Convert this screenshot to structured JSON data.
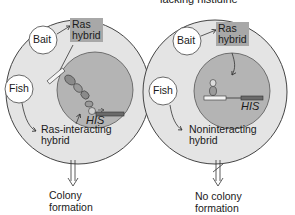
{
  "header": {
    "caption": "lacking histidine"
  },
  "panels": [
    {
      "bait_label": "Bait",
      "bait_product": "Ras\nhybrid",
      "bait_product_line1": "Ras",
      "bait_product_line2": "hybrid",
      "fish_label": "Fish",
      "fish_product_line1": "Ras-interacting",
      "fish_product_line2": "hybrid",
      "reporter_gene": "HIS",
      "outcome_line1": "Colony",
      "outcome_line2": "formation",
      "arrow": "double-arrow-down"
    },
    {
      "bait_label": "Bait",
      "bait_product_line1": "Ras",
      "bait_product_line2": "hybrid",
      "fish_label": "Fish",
      "fish_product_line1": "Noninteracting",
      "fish_product_line2": "hybrid",
      "reporter_gene": "HIS",
      "outcome_line1": "No colony",
      "outcome_line2": "formation",
      "arrow": "blocked-double-arrow-down"
    }
  ],
  "colors": {
    "cell_fill": "#e4e4e4",
    "nucleus_fill": "#b4b4b4",
    "ras_box": "#a8a8a8",
    "outline": "#333333"
  }
}
